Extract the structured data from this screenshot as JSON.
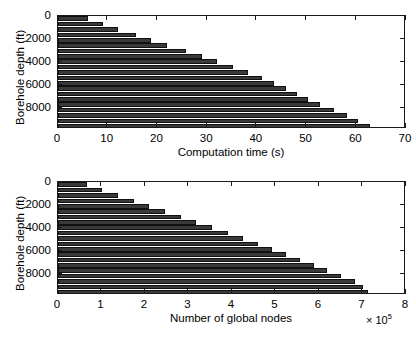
{
  "figure": {
    "background": "#ffffff",
    "bar_color": "#3a3a3a",
    "bar_edge_color": "#111111",
    "axis_color": "#1a1a1a"
  },
  "chart_data": [
    {
      "type": "bar",
      "orientation": "horizontal",
      "title": "",
      "xlabel": "Computation time (s)",
      "ylabel": "Borehole depth (ft)",
      "xlim": [
        0,
        70
      ],
      "ylim": [
        9800,
        0
      ],
      "y_inverted": true,
      "grid": false,
      "legend": null,
      "xticks": [
        0,
        10,
        20,
        30,
        40,
        50,
        60,
        70
      ],
      "xticklabels": [
        "0",
        "10",
        "20",
        "30",
        "40",
        "50",
        "60",
        "70"
      ],
      "yticks": [
        0,
        2000,
        4000,
        6000,
        8000
      ],
      "yticklabels": [
        "0",
        "2000",
        "4000",
        "6000",
        "8000"
      ],
      "categories": [
        250,
        700,
        1150,
        1600,
        2050,
        2500,
        2950,
        3400,
        3850,
        4300,
        4750,
        5200,
        5650,
        6100,
        6550,
        7000,
        7450,
        7900,
        8350,
        8800,
        9250
      ],
      "values": [
        6.0,
        9.0,
        12.0,
        15.6,
        18.8,
        22.0,
        25.7,
        28.9,
        31.9,
        35.1,
        38.2,
        41.0,
        43.5,
        45.9,
        48.0,
        50.3,
        52.6,
        55.6,
        58.2,
        60.4,
        62.8
      ]
    },
    {
      "type": "bar",
      "orientation": "horizontal",
      "title": "",
      "xlabel": "Number of global nodes",
      "ylabel": "Borehole depth (ft)",
      "x_exponent_label": "× 10",
      "x_exponent_power": "5",
      "xlim": [
        0,
        8
      ],
      "ylim": [
        9800,
        0
      ],
      "y_inverted": true,
      "grid": false,
      "legend": null,
      "xticks": [
        0,
        1,
        2,
        3,
        4,
        5,
        6,
        7,
        8
      ],
      "xticklabels": [
        "0",
        "1",
        "2",
        "3",
        "4",
        "5",
        "6",
        "7",
        "8"
      ],
      "yticks": [
        0,
        2000,
        4000,
        6000,
        8000
      ],
      "yticklabels": [
        "0",
        "2000",
        "4000",
        "6000",
        "8000"
      ],
      "categories": [
        250,
        700,
        1150,
        1600,
        2050,
        2500,
        2950,
        3400,
        3850,
        4300,
        4750,
        5200,
        5650,
        6100,
        6550,
        7000,
        7450,
        7900,
        8350,
        8800,
        9250
      ],
      "values": [
        0.67,
        1.02,
        1.38,
        1.75,
        2.1,
        2.46,
        2.82,
        3.18,
        3.54,
        3.9,
        4.25,
        4.6,
        4.93,
        5.25,
        5.57,
        5.88,
        6.18,
        6.5,
        6.82,
        7.0,
        7.13
      ]
    }
  ]
}
